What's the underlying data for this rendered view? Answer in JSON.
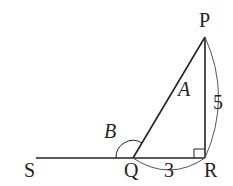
{
  "diagram": {
    "type": "geometry-right-triangle",
    "points": {
      "P": "P",
      "Q": "Q",
      "R": "R",
      "S": "S"
    },
    "angles": {
      "A": "A",
      "B": "B"
    },
    "lengths": {
      "PR": "5",
      "QR": "3"
    },
    "colors": {
      "stroke": "#222222",
      "arc": "#555555",
      "background": "#ffffff"
    }
  }
}
